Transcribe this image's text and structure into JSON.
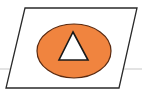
{
  "diagram": {
    "background_color": "#ffffff",
    "guide_line": {
      "color": "#c8c8c8",
      "y": 69
    },
    "plane": {
      "shape": "parallelogram",
      "fill": "#ffffff",
      "stroke": "#2a2a2a",
      "points": "25,8 137,8 119,88 6,88"
    },
    "ellipse": {
      "fill": "#f0843f",
      "stroke": "#5a2a10",
      "cx": 74,
      "cy": 51,
      "rx": 37,
      "ry": 27
    },
    "triangle": {
      "fill": "#ffffff",
      "stroke": "#1a1a1a",
      "points": "73,32 88,60 59,60"
    }
  }
}
